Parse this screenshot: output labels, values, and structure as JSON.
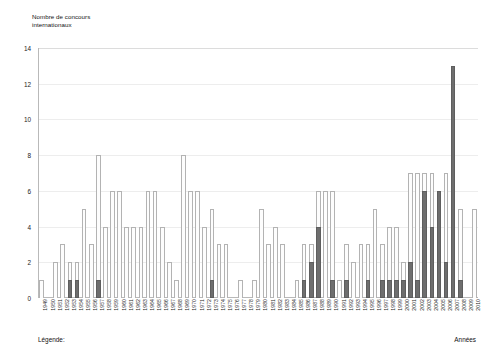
{
  "chart_data": {
    "type": "bar",
    "title": "",
    "subtitle": "",
    "ylabel_line1": "Nombre de concours",
    "ylabel_line2": "internationaux",
    "xlabel": "Années",
    "legend_label": "Légende:",
    "legend_position": "bottom-left",
    "grid": true,
    "ylim": [
      0,
      14
    ],
    "ytick_step": 2,
    "yticks": [
      "0",
      "2",
      "4",
      "6",
      "8",
      "10",
      "12",
      "14"
    ],
    "stacked": true,
    "colors": {
      "series_light": "#fdfdfd",
      "series_light_border": "#b3b3b3",
      "series_dark": "#6e6e6e",
      "series_dark_border": "#5e5e5e",
      "axis": "#b9b9b9",
      "gridline": "#ededed",
      "text": "#1a1a1a"
    },
    "categories": [
      "1949",
      "1950",
      "1951",
      "1952",
      "1953",
      "1954",
      "1955",
      "1956",
      "1957",
      "1958",
      "1959",
      "1960",
      "1961",
      "1962",
      "1963",
      "1964",
      "1965",
      "1966",
      "1967",
      "1968",
      "1969",
      "1970",
      "1971",
      "1972",
      "1973",
      "1974",
      "1975",
      "1976",
      "1977",
      "1978",
      "1979",
      "1980",
      "1981",
      "1982",
      "1983",
      "1984",
      "1985",
      "1986",
      "1987",
      "1988",
      "1989",
      "1990",
      "1991",
      "1992",
      "1993",
      "1994",
      "1995",
      "1996",
      "1997",
      "1998",
      "1999",
      "2000",
      "2001",
      "2002",
      "2003",
      "2004",
      "2005",
      "2006",
      "2007",
      "2008",
      "2009",
      "2010"
    ],
    "series": [
      {
        "name": "series-dark",
        "values": [
          0,
          0,
          0,
          0,
          1,
          1,
          0,
          0,
          1,
          0,
          0,
          0,
          0,
          0,
          0,
          0,
          0,
          0,
          0,
          0,
          0,
          0,
          0,
          0,
          1,
          0,
          0,
          0,
          0,
          0,
          0,
          0,
          0,
          0,
          0,
          0,
          0,
          1,
          2,
          4,
          0,
          1,
          0,
          1,
          0,
          0,
          1,
          0,
          1,
          1,
          1,
          1,
          2,
          1,
          6,
          4,
          6,
          2,
          13,
          1,
          0,
          0
        ]
      },
      {
        "name": "series-light",
        "values": [
          1,
          0,
          2,
          3,
          1,
          1,
          5,
          3,
          7,
          4,
          6,
          6,
          4,
          4,
          4,
          6,
          6,
          4,
          2,
          1,
          8,
          6,
          6,
          4,
          4,
          3,
          3,
          0,
          1,
          0,
          1,
          5,
          3,
          4,
          3,
          0,
          1,
          2,
          1,
          2,
          6,
          5,
          1,
          2,
          2,
          3,
          2,
          5,
          2,
          3,
          3,
          1,
          5,
          6,
          1,
          3,
          0,
          5,
          0,
          4,
          0,
          5
        ]
      }
    ],
    "totals": [
      1,
      0,
      2,
      3,
      2,
      2,
      5,
      3,
      8,
      4,
      6,
      6,
      4,
      4,
      4,
      6,
      6,
      4,
      2,
      1,
      8,
      6,
      6,
      4,
      5,
      3,
      3,
      0,
      1,
      0,
      1,
      5,
      3,
      4,
      3,
      0,
      1,
      3,
      3,
      6,
      6,
      6,
      1,
      3,
      2,
      3,
      3,
      5,
      3,
      4,
      4,
      2,
      7,
      7,
      7,
      7,
      6,
      7,
      13,
      5,
      0,
      5
    ]
  }
}
